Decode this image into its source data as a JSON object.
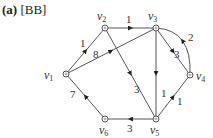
{
  "title": {
    "prefix": "(a)",
    "tag": "[BB]"
  },
  "graph": {
    "directed": true,
    "nodes": [
      {
        "id": "v1",
        "label": "v",
        "sub": "1",
        "x": 66,
        "y": 74,
        "lx": 44,
        "ly": 79
      },
      {
        "id": "v2",
        "label": "v",
        "sub": "2",
        "x": 105,
        "y": 28,
        "lx": 97,
        "ly": 20
      },
      {
        "id": "v3",
        "label": "v",
        "sub": "3",
        "x": 156,
        "y": 28,
        "lx": 148,
        "ly": 20
      },
      {
        "id": "v4",
        "label": "v",
        "sub": "4",
        "x": 190,
        "y": 75,
        "lx": 196,
        "ly": 80
      },
      {
        "id": "v5",
        "label": "v",
        "sub": "5",
        "x": 156,
        "y": 119,
        "lx": 150,
        "ly": 134
      },
      {
        "id": "v6",
        "label": "v",
        "sub": "6",
        "x": 105,
        "y": 119,
        "lx": 99,
        "ly": 134
      }
    ],
    "edges": [
      {
        "from": "v1",
        "to": "v2",
        "weight": "1",
        "lx": 80,
        "ly": 47
      },
      {
        "from": "v1",
        "to": "v3",
        "weight": "8",
        "lx": 93,
        "ly": 58
      },
      {
        "from": "v2",
        "to": "v3",
        "weight": "1",
        "lx": 126,
        "ly": 23
      },
      {
        "from": "v2",
        "to": "v5",
        "weight": "3",
        "lx": 134,
        "ly": 93
      },
      {
        "from": "v3",
        "to": "v5",
        "weight": "1",
        "lx": 161,
        "ly": 97
      },
      {
        "from": "v3",
        "to": "v4",
        "weight": "3",
        "lx": 174,
        "ly": 58
      },
      {
        "from": "v4",
        "to": "v3",
        "weight": "2",
        "lx": 188,
        "ly": 41,
        "curved": true
      },
      {
        "from": "v5",
        "to": "v4",
        "weight": "1",
        "lx": 177,
        "ly": 105
      },
      {
        "from": "v5",
        "to": "v6",
        "weight": "3",
        "lx": 127,
        "ly": 132
      },
      {
        "from": "v6",
        "to": "v1",
        "weight": "7",
        "lx": 70,
        "ly": 98
      }
    ]
  },
  "colors": {
    "edge": "#555555",
    "node_fill": "#ffffff",
    "node_stroke": "#555555",
    "text": "#333333"
  }
}
